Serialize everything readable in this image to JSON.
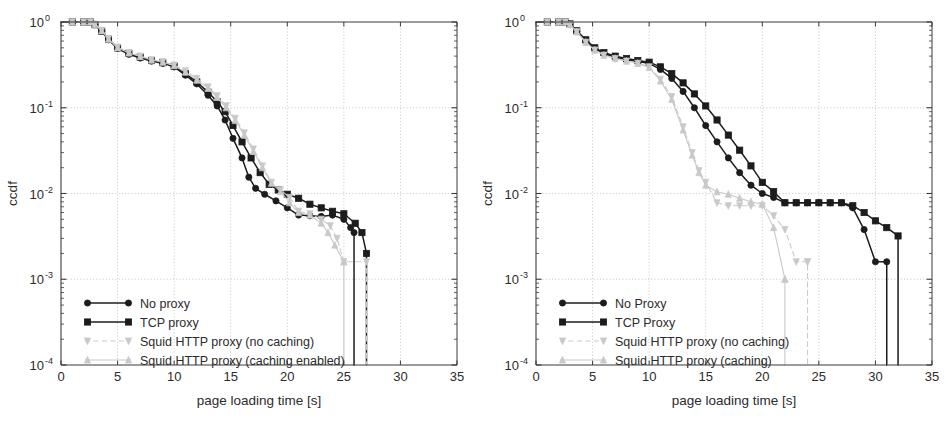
{
  "figure": {
    "panels": [
      {
        "id": "left",
        "axes": {
          "xlabel": "page loading time [s]",
          "ylabel": "ccdf",
          "xticks": [
            "0",
            "5",
            "10",
            "15",
            "20",
            "25",
            "30",
            "35"
          ],
          "xtick_values": [
            0,
            5,
            10,
            15,
            20,
            25,
            30,
            35
          ],
          "yticks": [
            "10",
            "10",
            "10",
            "10",
            "10"
          ],
          "ytick_exponents": [
            "0",
            "-1",
            "-2",
            "-3",
            "-4"
          ],
          "ytick_values": [
            1,
            0.1,
            0.01,
            0.001,
            0.0001
          ],
          "xlim": [
            0,
            35
          ],
          "ylim": [
            0.0001,
            1
          ],
          "yscale": "log",
          "grid": true
        },
        "legend": {
          "items": [
            {
              "label": "No proxy",
              "color": "#1c1c1c",
              "style": "solid",
              "marker": "circle"
            },
            {
              "label": "TCP proxy",
              "color": "#1c1c1c",
              "style": "solid",
              "marker": "square"
            },
            {
              "label": "Squid HTTP proxy (no caching)",
              "color": "#c9c9c9",
              "style": "dashed",
              "marker": "triangle-down"
            },
            {
              "label": "Squid HTTP proxy (caching enabled)",
              "color": "#c9c9c9",
              "style": "solid",
              "marker": "triangle-up"
            }
          ]
        }
      },
      {
        "id": "right",
        "axes": {
          "xlabel": "page loading time [s]",
          "ylabel": "ccdf",
          "xticks": [
            "0",
            "5",
            "10",
            "15",
            "20",
            "25",
            "30",
            "35"
          ],
          "xtick_values": [
            0,
            5,
            10,
            15,
            20,
            25,
            30,
            35
          ],
          "yticks": [
            "10",
            "10",
            "10",
            "10",
            "10"
          ],
          "ytick_exponents": [
            "0",
            "-1",
            "-2",
            "-3",
            "-4"
          ],
          "ytick_values": [
            1,
            0.1,
            0.01,
            0.001,
            0.0001
          ],
          "xlim": [
            0,
            35
          ],
          "ylim": [
            0.0001,
            1
          ],
          "yscale": "log",
          "grid": true
        },
        "legend": {
          "items": [
            {
              "label": "No Proxy",
              "color": "#1c1c1c",
              "style": "solid",
              "marker": "circle"
            },
            {
              "label": "TCP Proxy",
              "color": "#1c1c1c",
              "style": "solid",
              "marker": "square"
            },
            {
              "label": "Squid HTTP proxy (no caching)",
              "color": "#c9c9c9",
              "style": "dashed",
              "marker": "triangle-down"
            },
            {
              "label": "Squid HTTP proxy (caching)",
              "color": "#c9c9c9",
              "style": "solid",
              "marker": "triangle-up"
            }
          ]
        }
      }
    ]
  },
  "chart_data": [
    {
      "type": "line",
      "title": "",
      "xlabel": "page loading time [s]",
      "ylabel": "ccdf",
      "xlim": [
        0,
        35
      ],
      "ylim": [
        0.0001,
        1
      ],
      "yscale": "log",
      "grid": true,
      "legend_position": "lower-left",
      "series": [
        {
          "name": "No proxy",
          "color": "#1c1c1c",
          "style": "solid",
          "marker": "circle",
          "x": [
            0,
            1,
            2,
            2.6,
            3,
            3.6,
            4.2,
            5,
            6,
            7,
            8,
            9,
            10,
            11,
            12,
            13,
            13.8,
            14.5,
            15.2,
            16,
            16.6,
            17.2,
            18,
            19,
            20,
            21,
            22,
            23,
            24,
            25,
            25.6,
            25.9,
            25.9
          ],
          "y": [
            1.0,
            1.0,
            1.0,
            1.0,
            0.93,
            0.78,
            0.62,
            0.49,
            0.42,
            0.38,
            0.35,
            0.33,
            0.3,
            0.24,
            0.19,
            0.14,
            0.105,
            0.072,
            0.044,
            0.026,
            0.0155,
            0.0115,
            0.0098,
            0.0082,
            0.0068,
            0.0056,
            0.0055,
            0.0054,
            0.0056,
            0.005,
            0.004,
            0.0035,
            0.0001
          ]
        },
        {
          "name": "TCP proxy",
          "color": "#1c1c1c",
          "style": "solid",
          "marker": "square",
          "x": [
            0,
            1,
            2,
            2.6,
            3,
            3.6,
            4.2,
            5,
            6,
            7,
            8,
            9,
            10,
            11,
            12,
            13,
            13.8,
            14.5,
            15.2,
            16,
            16.8,
            17.6,
            18.4,
            19.2,
            20,
            21,
            22,
            23,
            24,
            25,
            26,
            26.6,
            27,
            27
          ],
          "y": [
            1.0,
            1.0,
            1.0,
            1.0,
            0.93,
            0.78,
            0.63,
            0.5,
            0.43,
            0.39,
            0.355,
            0.335,
            0.305,
            0.25,
            0.2,
            0.152,
            0.118,
            0.09,
            0.062,
            0.04,
            0.026,
            0.0175,
            0.0128,
            0.011,
            0.0098,
            0.0088,
            0.0075,
            0.0068,
            0.0062,
            0.0058,
            0.0045,
            0.0035,
            0.002,
            0.0001
          ]
        },
        {
          "name": "Squid HTTP proxy (no caching)",
          "color": "#c9c9c9",
          "style": "dashed",
          "marker": "triangle-down",
          "x": [
            0,
            1,
            2,
            2.6,
            3,
            3.6,
            4.2,
            5,
            6,
            7,
            8,
            9,
            10,
            11,
            12,
            13,
            13.8,
            14.6,
            15.4,
            16.2,
            17,
            17.8,
            18.6,
            19.4,
            20.2,
            21,
            22,
            23,
            23.8,
            24.4,
            25,
            27,
            27
          ],
          "y": [
            1.0,
            1.0,
            1.0,
            1.0,
            0.94,
            0.8,
            0.64,
            0.51,
            0.44,
            0.4,
            0.365,
            0.345,
            0.315,
            0.27,
            0.22,
            0.175,
            0.138,
            0.105,
            0.075,
            0.051,
            0.033,
            0.021,
            0.0135,
            0.011,
            0.009,
            0.0062,
            0.0058,
            0.005,
            0.0042,
            0.003,
            0.0016,
            0.0016,
            0.0001
          ]
        },
        {
          "name": "Squid HTTP proxy (caching enabled)",
          "color": "#c9c9c9",
          "style": "solid",
          "marker": "triangle-up",
          "x": [
            0,
            1,
            2,
            2.6,
            3,
            3.6,
            4.2,
            5,
            6,
            7,
            8,
            9,
            10,
            11,
            12,
            13,
            13.8,
            14.6,
            15.4,
            16.2,
            17,
            17.8,
            18.6,
            19.4,
            20.2,
            21,
            22,
            23,
            23.6,
            24.2,
            25,
            25,
            25
          ],
          "y": [
            1.0,
            1.0,
            1.0,
            1.0,
            0.94,
            0.79,
            0.63,
            0.5,
            0.435,
            0.395,
            0.36,
            0.34,
            0.31,
            0.26,
            0.21,
            0.168,
            0.132,
            0.1,
            0.071,
            0.048,
            0.031,
            0.02,
            0.0132,
            0.0105,
            0.0078,
            0.006,
            0.0056,
            0.0045,
            0.0035,
            0.0025,
            0.0016,
            0.0016,
            0.0001
          ]
        }
      ]
    },
    {
      "type": "line",
      "title": "",
      "xlabel": "page loading time [s]",
      "ylabel": "ccdf",
      "xlim": [
        0,
        35
      ],
      "ylim": [
        0.0001,
        1
      ],
      "yscale": "log",
      "grid": true,
      "legend_position": "lower-left",
      "series": [
        {
          "name": "No Proxy",
          "color": "#1c1c1c",
          "style": "solid",
          "marker": "circle",
          "x": [
            0,
            1,
            2,
            2.6,
            3,
            3.6,
            4.4,
            5.2,
            6,
            7,
            8,
            9,
            10,
            11,
            12,
            13,
            14,
            15,
            16,
            17,
            18,
            19,
            20,
            21,
            22,
            23,
            24,
            25,
            26,
            27,
            28,
            29,
            30,
            31,
            31
          ],
          "y": [
            1.0,
            1.0,
            1.0,
            1.0,
            0.94,
            0.78,
            0.6,
            0.49,
            0.43,
            0.39,
            0.365,
            0.345,
            0.33,
            0.28,
            0.22,
            0.155,
            0.1,
            0.062,
            0.04,
            0.026,
            0.0175,
            0.0125,
            0.01,
            0.009,
            0.0078,
            0.0078,
            0.0078,
            0.0078,
            0.0078,
            0.0078,
            0.0068,
            0.0038,
            0.0016,
            0.0016,
            0.0001
          ]
        },
        {
          "name": "TCP Proxy",
          "color": "#1c1c1c",
          "style": "solid",
          "marker": "square",
          "x": [
            0,
            1,
            2,
            2.6,
            3,
            3.6,
            4.4,
            5.2,
            6,
            7,
            8,
            9,
            10,
            11,
            12,
            13,
            14,
            15,
            16,
            17,
            18,
            19,
            20,
            21,
            22,
            23,
            24,
            25,
            26,
            27,
            28,
            29,
            30,
            31,
            32,
            32
          ],
          "y": [
            1.0,
            1.0,
            1.0,
            1.0,
            0.95,
            0.79,
            0.62,
            0.5,
            0.44,
            0.4,
            0.375,
            0.355,
            0.34,
            0.3,
            0.25,
            0.195,
            0.145,
            0.105,
            0.072,
            0.048,
            0.032,
            0.021,
            0.0135,
            0.0105,
            0.0078,
            0.0078,
            0.0078,
            0.0078,
            0.0078,
            0.0078,
            0.0072,
            0.006,
            0.0048,
            0.004,
            0.0032,
            0.0001
          ]
        },
        {
          "name": "Squid HTTP proxy (no caching)",
          "color": "#c9c9c9",
          "style": "dashed",
          "marker": "triangle-down",
          "x": [
            0,
            1,
            2,
            2.6,
            3,
            3.6,
            4.4,
            5.2,
            6,
            7,
            8,
            9,
            10,
            11,
            12,
            13,
            13.8,
            14.4,
            15,
            16,
            17,
            18,
            19,
            20,
            21,
            22,
            23,
            24,
            24,
            24
          ],
          "y": [
            1.0,
            1.0,
            1.0,
            1.0,
            0.93,
            0.77,
            0.58,
            0.47,
            0.41,
            0.375,
            0.35,
            0.33,
            0.3,
            0.215,
            0.135,
            0.06,
            0.03,
            0.0185,
            0.0135,
            0.0078,
            0.0072,
            0.0072,
            0.0072,
            0.0072,
            0.0055,
            0.0038,
            0.0016,
            0.0016,
            0.0016,
            0.0001
          ]
        },
        {
          "name": "Squid HTTP proxy (caching)",
          "color": "#c9c9c9",
          "style": "solid",
          "marker": "triangle-up",
          "x": [
            0,
            1,
            2,
            2.6,
            3,
            3.6,
            4.4,
            5.2,
            6,
            7,
            8,
            9,
            10,
            11,
            12,
            13,
            13.8,
            14.4,
            15,
            16,
            17,
            18,
            19,
            20,
            21,
            22,
            22,
            22
          ],
          "y": [
            1.0,
            1.0,
            1.0,
            1.0,
            0.93,
            0.77,
            0.58,
            0.47,
            0.41,
            0.375,
            0.35,
            0.33,
            0.295,
            0.205,
            0.125,
            0.055,
            0.028,
            0.0175,
            0.0125,
            0.0105,
            0.0098,
            0.0088,
            0.008,
            0.0075,
            0.004,
            0.001,
            0.001,
            0.0001
          ]
        }
      ]
    }
  ]
}
